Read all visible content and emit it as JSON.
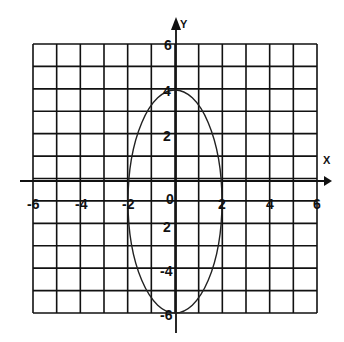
{
  "chart_data": {
    "type": "line",
    "title": "",
    "xlabel": "X",
    "ylabel": "Y",
    "xlim": [
      -6,
      6
    ],
    "ylim": [
      -6,
      6
    ],
    "grid": true,
    "grid_step": 1,
    "x_tick_labels": [
      "-6",
      "-4",
      "-2",
      "2",
      "4",
      "6"
    ],
    "x_tick_values": [
      -6,
      -4,
      -2,
      2,
      4,
      6
    ],
    "y_tick_labels": [
      "6",
      "4",
      "2",
      "0",
      "2",
      "-4",
      "-6"
    ],
    "y_tick_values": [
      6,
      4,
      2,
      0,
      -2,
      -4,
      -6
    ],
    "origin_label": "0",
    "series": [
      {
        "name": "ellipse",
        "shape": "ellipse",
        "center": [
          0,
          -1
        ],
        "semi_axis_x": 2,
        "semi_axis_y": 5,
        "equation": "x^2/4 + (y+1)^2/25 = 1",
        "key_points": [
          [
            0,
            4
          ],
          [
            0,
            -6
          ],
          [
            -2,
            -1
          ],
          [
            2,
            -1
          ]
        ]
      }
    ]
  },
  "labels": {
    "x_axis": "X",
    "y_axis": "Y",
    "origin": "0",
    "x_ticks": [
      "-6",
      "-4",
      "-2",
      "2",
      "4",
      "6"
    ],
    "y_ticks_top": [
      "6",
      "4",
      "2"
    ],
    "y_ticks_bottom": [
      "2",
      "-4",
      "-6"
    ]
  },
  "colors": {
    "ink": "#111111",
    "background": "#ffffff"
  }
}
